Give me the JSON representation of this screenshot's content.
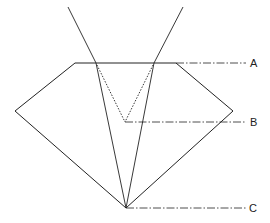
{
  "diagram": {
    "type": "gemstone-cross-section-light-path",
    "labels": {
      "A": "A",
      "B": "B",
      "C": "C"
    },
    "colors": {
      "line": "#222222",
      "background": "#ffffff"
    }
  }
}
